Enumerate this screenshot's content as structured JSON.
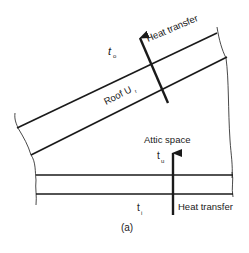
{
  "figure": {
    "caption": "(a)",
    "labels": {
      "outdoor_temp": "t",
      "outdoor_temp_sub": "o",
      "roof": "Roof U",
      "roof_sub": "r",
      "roof_heat": "Heat transfer",
      "attic": "Attic space",
      "attic_temp": "t",
      "attic_temp_sub": "u",
      "indoor_temp": "t",
      "indoor_temp_sub": "i",
      "ceiling_heat": "Heat transfer"
    },
    "colors": {
      "stroke": "#1a1a1a",
      "background": "#ffffff"
    }
  }
}
